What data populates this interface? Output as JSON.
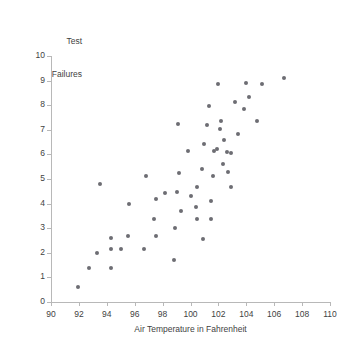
{
  "chart_data": {
    "type": "scatter",
    "title": "Test Failures",
    "title_lines": [
      "Test",
      "Failures"
    ],
    "xlabel": "Air Temperature in Fahrenheit",
    "ylabel": "Test Failures",
    "xlim": [
      90,
      110
    ],
    "ylim": [
      0,
      10
    ],
    "xticks": [
      90,
      92,
      94,
      96,
      98,
      100,
      102,
      104,
      106,
      108,
      110
    ],
    "yticks": [
      0,
      1,
      2,
      3,
      4,
      5,
      6,
      7,
      8,
      9,
      10
    ],
    "grid": false,
    "legend": null,
    "marker_color": "#6d6d73",
    "axis_color": "#b8b8b8",
    "text_color": "#3f3f3f",
    "n_points": 63,
    "points": [
      [
        91.9,
        0.61
      ],
      [
        92.7,
        1.38
      ],
      [
        93.3,
        1.99
      ],
      [
        93.5,
        4.78
      ],
      [
        94.3,
        1.4
      ],
      [
        94.3,
        2.15
      ],
      [
        94.3,
        2.62
      ],
      [
        95.0,
        2.15
      ],
      [
        95.5,
        2.67
      ],
      [
        95.6,
        3.99
      ],
      [
        96.7,
        2.15
      ],
      [
        96.8,
        5.12
      ],
      [
        97.4,
        3.38
      ],
      [
        97.5,
        2.68
      ],
      [
        97.5,
        4.2
      ],
      [
        98.2,
        4.45
      ],
      [
        98.8,
        1.71
      ],
      [
        98.9,
        3.02
      ],
      [
        99.0,
        4.47
      ],
      [
        99.1,
        7.25
      ],
      [
        99.2,
        5.25
      ],
      [
        99.3,
        3.7
      ],
      [
        99.8,
        6.12
      ],
      [
        100.0,
        4.3
      ],
      [
        100.4,
        3.86
      ],
      [
        100.5,
        3.37
      ],
      [
        100.5,
        4.67
      ],
      [
        100.8,
        5.4
      ],
      [
        100.9,
        2.58
      ],
      [
        101.0,
        6.41
      ],
      [
        101.2,
        7.18
      ],
      [
        101.3,
        7.95
      ],
      [
        101.5,
        3.37
      ],
      [
        101.5,
        4.12
      ],
      [
        101.6,
        5.13
      ],
      [
        101.7,
        6.15
      ],
      [
        101.9,
        6.21
      ],
      [
        102.0,
        8.85
      ],
      [
        102.1,
        7.02
      ],
      [
        102.2,
        7.36
      ],
      [
        102.3,
        5.62
      ],
      [
        102.4,
        6.58
      ],
      [
        102.6,
        6.08
      ],
      [
        102.7,
        5.3
      ],
      [
        102.9,
        6.07
      ],
      [
        102.9,
        4.66
      ],
      [
        103.2,
        8.11
      ],
      [
        103.4,
        6.82
      ],
      [
        103.8,
        7.84
      ],
      [
        104.0,
        8.91
      ],
      [
        104.2,
        8.33
      ],
      [
        104.8,
        7.35
      ],
      [
        105.1,
        8.87
      ],
      [
        106.7,
        9.12
      ]
    ]
  }
}
